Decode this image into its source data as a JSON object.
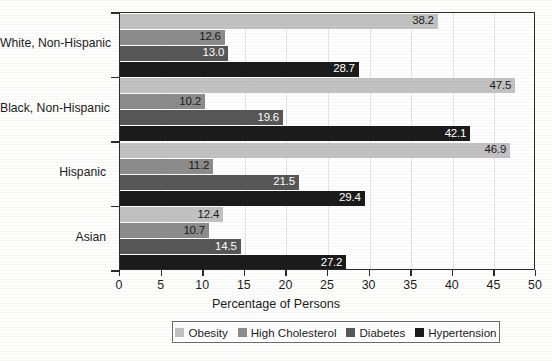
{
  "chart_data": {
    "type": "bar",
    "orientation": "horizontal",
    "title": "",
    "xlabel": "Percentage of Persons",
    "ylabel": "",
    "xlim": [
      0,
      50
    ],
    "xticks": [
      0,
      5,
      10,
      15,
      20,
      25,
      30,
      35,
      40,
      45,
      50
    ],
    "grid": true,
    "grid_axis": "x",
    "legend_position": "bottom",
    "categories": [
      "White, Non-Hispanic",
      "Black, Non-Hispanic",
      "Hispanic",
      "Asian"
    ],
    "series": [
      {
        "name": "Obesity",
        "color": "#c2c2c2",
        "label_color": "#1a1a1a",
        "values": [
          38.2,
          47.5,
          46.9,
          12.4
        ]
      },
      {
        "name": "High Cholesterol",
        "color": "#8c8c8c",
        "label_color": "#1a1a1a",
        "values": [
          12.6,
          10.2,
          11.2,
          10.7
        ]
      },
      {
        "name": "Diabetes",
        "color": "#575757",
        "label_color": "#ffffff",
        "values": [
          13.0,
          19.6,
          21.5,
          14.5
        ]
      },
      {
        "name": "Hypertension",
        "color": "#1b1b1b",
        "label_color": "#ffffff",
        "values": [
          28.7,
          42.1,
          29.4,
          27.2
        ]
      }
    ],
    "data_labels": {
      "White, Non-Hispanic": [
        "38.2",
        "12.6",
        "13.0",
        "28.7"
      ],
      "Black, Non-Hispanic": [
        "47.5",
        "10.2",
        "19.6",
        "42.1"
      ],
      "Hispanic": [
        "46.9",
        "11.2",
        "21.5",
        "29.4"
      ],
      "Asian": [
        "12.4",
        "10.7",
        "14.5",
        "27.2"
      ]
    }
  },
  "axis": {
    "x_title": "Percentage of Persons",
    "tick_labels": [
      "0",
      "5",
      "10",
      "15",
      "20",
      "25",
      "30",
      "35",
      "40",
      "45",
      "50"
    ]
  },
  "legend": {
    "items": [
      {
        "label": "Obesity"
      },
      {
        "label": "High Cholesterol"
      },
      {
        "label": "Diabetes"
      },
      {
        "label": "Hypertension"
      }
    ]
  }
}
